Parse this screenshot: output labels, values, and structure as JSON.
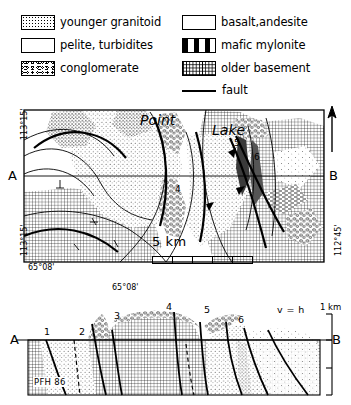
{
  "legend": {
    "items": [
      {
        "key": "younger-granitoid",
        "label": "younger granitoid",
        "pattern": "coarse-speckle"
      },
      {
        "key": "basalt-andesite",
        "label": "basalt,andesite",
        "pattern": "sparse-dots"
      },
      {
        "key": "pelite-turbidites",
        "label": "pelite, turbidites",
        "pattern": "fine-stipple"
      },
      {
        "key": "mafic-mylonite",
        "label": "mafic mylonite",
        "pattern": "horizontal-dashes"
      },
      {
        "key": "conglomerate",
        "label": "conglomerate",
        "pattern": "pebble-rings"
      },
      {
        "key": "older-basement",
        "label": "older basement",
        "pattern": "cross-hatch"
      },
      {
        "key": "fault",
        "label": "fault",
        "pattern": "solid-line"
      }
    ]
  },
  "map": {
    "place_labels": [
      {
        "name": "point",
        "text": "Point"
      },
      {
        "name": "lake",
        "text": "Lake"
      }
    ],
    "coordinates": {
      "top_left_longitude": "113°15'",
      "bottom_left_longitude": "113°15'",
      "bottom_left_latitude": "65°08'",
      "bottom_center_latitude": "65°08'",
      "right_longitude": "112°45'"
    },
    "section_line": {
      "start": "A",
      "end": "B"
    },
    "unit_numbers": [
      "4",
      "5",
      "6"
    ],
    "scale": {
      "label": "5 km",
      "segments": 5
    },
    "north_arrow": "north-arrow"
  },
  "section": {
    "end_labels": {
      "left": "A",
      "right": "B"
    },
    "unit_numbers": [
      "1",
      "2",
      "3",
      "4",
      "5",
      "6"
    ],
    "vertical_exaggeration": "v = h",
    "scale_label": "1 km",
    "credit": "PFH 86"
  },
  "colors": {
    "ink": "#000000",
    "paper": "#ffffff"
  }
}
